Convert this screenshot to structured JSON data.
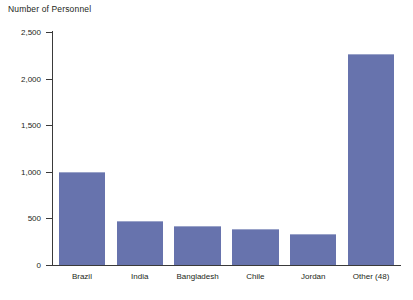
{
  "chart_data": {
    "type": "bar",
    "title": "Number of Personnel",
    "xlabel": "",
    "ylabel": "Number of Personnel",
    "categories": [
      "Brazil",
      "India",
      "Bangladesh",
      "Chile",
      "Jordan",
      "Other (48)"
    ],
    "values": [
      1000,
      470,
      420,
      385,
      330,
      2260
    ],
    "ylim": [
      0,
      2500
    ],
    "yticks": [
      0,
      500,
      1000,
      1500,
      2000,
      2500
    ],
    "ytick_labels": [
      "0",
      "500",
      "1,000",
      "1,500",
      "2,000",
      "2,500"
    ],
    "grid": false,
    "legend": null,
    "series": [
      {
        "name": "Number of Personnel",
        "color": "#6773ad",
        "values": [
          1000,
          470,
          420,
          385,
          330,
          2260
        ]
      }
    ],
    "colors": {
      "bar_fill": "#6773ad",
      "bar_top_edge": "#9aa3c9",
      "axis": "#3a3a3a",
      "text": "#231f20",
      "background": "#ffffff"
    }
  }
}
